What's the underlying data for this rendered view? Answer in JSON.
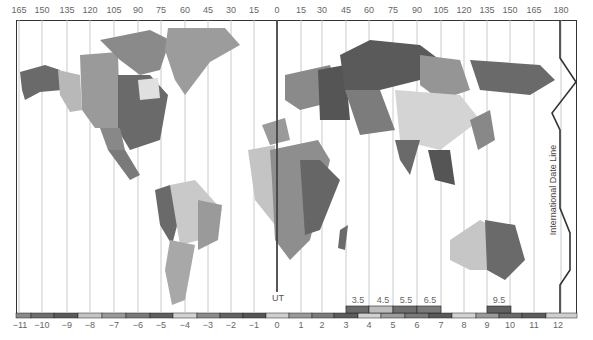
{
  "map": {
    "title": "World Time Zones",
    "longitude_labels": [
      {
        "label": "165",
        "x": 19
      },
      {
        "label": "150",
        "x": 42
      },
      {
        "label": "135",
        "x": 67
      },
      {
        "label": "120",
        "x": 90
      },
      {
        "label": "105",
        "x": 114
      },
      {
        "label": "90",
        "x": 138
      },
      {
        "label": "75",
        "x": 161
      },
      {
        "label": "60",
        "x": 185
      },
      {
        "label": "45",
        "x": 208
      },
      {
        "label": "30",
        "x": 231
      },
      {
        "label": "15",
        "x": 254
      },
      {
        "label": "0",
        "x": 277
      },
      {
        "label": "15",
        "x": 301
      },
      {
        "label": "30",
        "x": 322
      },
      {
        "label": "45",
        "x": 346
      },
      {
        "label": "60",
        "x": 369
      },
      {
        "label": "75",
        "x": 393
      },
      {
        "label": "90",
        "x": 417
      },
      {
        "label": "105",
        "x": 441
      },
      {
        "label": "120",
        "x": 464
      },
      {
        "label": "135",
        "x": 487
      },
      {
        "label": "150",
        "x": 510
      },
      {
        "label": "165",
        "x": 534
      },
      {
        "label": "180",
        "x": 561
      }
    ],
    "zone_labels": [
      {
        "label": "−11",
        "x": 20
      },
      {
        "label": "−10",
        "x": 42
      },
      {
        "label": "−9",
        "x": 67
      },
      {
        "label": "−8",
        "x": 90
      },
      {
        "label": "−7",
        "x": 114
      },
      {
        "label": "−6",
        "x": 138
      },
      {
        "label": "−5",
        "x": 161
      },
      {
        "label": "−4",
        "x": 185
      },
      {
        "label": "−3",
        "x": 208
      },
      {
        "label": "−2",
        "x": 231
      },
      {
        "label": "−1",
        "x": 254
      },
      {
        "label": "0",
        "x": 277
      },
      {
        "label": "1",
        "x": 301
      },
      {
        "label": "2",
        "x": 322
      },
      {
        "label": "3",
        "x": 346
      },
      {
        "label": "4",
        "x": 369
      },
      {
        "label": "5",
        "x": 393
      },
      {
        "label": "6",
        "x": 417
      },
      {
        "label": "7",
        "x": 441
      },
      {
        "label": "8",
        "x": 464
      },
      {
        "label": "9",
        "x": 487
      },
      {
        "label": "10",
        "x": 510
      },
      {
        "label": "11",
        "x": 534
      },
      {
        "label": "12",
        "x": 558
      }
    ],
    "half_hour_labels": [
      {
        "label": "3.5",
        "x": 358
      },
      {
        "label": "4.5",
        "x": 383
      },
      {
        "label": "5.5",
        "x": 406
      },
      {
        "label": "6.5",
        "x": 430
      },
      {
        "label": "9.5",
        "x": 499
      }
    ],
    "ut_label": "UT",
    "date_line_label": "International Date Line",
    "zone_bar_colors": [
      "#8a8a8a",
      "#6e6e6e",
      "#5a5a5a",
      "#c4c4c4",
      "#9a9a9a",
      "#7a7a7a",
      "#5e5e5e",
      "#d2d2d2",
      "#8c8c8c",
      "#626262",
      "#555555",
      "#cfcfcf",
      "#9a9a9a",
      "#7c7c7c",
      "#5c5c5c",
      "#d0d0d0",
      "#9c9c9c",
      "#7a7a7a",
      "#5a5a5a",
      "#d2d2d2",
      "#9a9a9a",
      "#6a6a6a",
      "#5c5c5c",
      "#cfcfcf"
    ],
    "colors": {
      "frame": "#333333",
      "gridline": "#bbbbbb",
      "ut_line": "#444444",
      "date_line": "#333333"
    }
  }
}
